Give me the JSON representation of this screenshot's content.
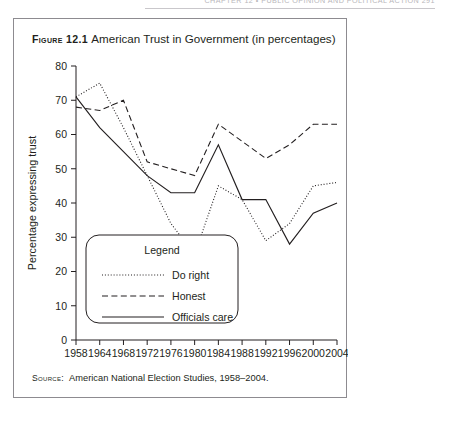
{
  "running_header": {
    "text": "CHAPTER 12  •  PUBLIC OPINION AND POLITICAL ACTION   291"
  },
  "figure": {
    "label": "Figure 12.1",
    "caption": "American Trust in Government (in percentages)",
    "source_label": "Source:",
    "source_text": "American National Election Studies, 1958–2004."
  },
  "chart_data": {
    "type": "line",
    "title": "American Trust in Government (in percentages)",
    "xlabel": "",
    "ylabel": "Percentage expressing trust",
    "x": [
      1958,
      1964,
      1968,
      1972,
      1976,
      1980,
      1984,
      1988,
      1992,
      1996,
      2000,
      2004
    ],
    "xtick_labels": [
      "1958",
      "1964",
      "1968",
      "1972",
      "1976",
      "1980",
      "1984",
      "1988",
      "1992",
      "1996",
      "2000",
      "2004"
    ],
    "ytick_labels": [
      "0",
      "10",
      "20",
      "30",
      "40",
      "50",
      "60",
      "70",
      "80"
    ],
    "yticks": [
      0,
      10,
      20,
      30,
      40,
      50,
      60,
      70,
      80
    ],
    "ylim": [
      0,
      80
    ],
    "grid": false,
    "legend_position": "lower-left-inside",
    "legend_title": "Legend",
    "series": [
      {
        "key": "do_right",
        "name": "Do right",
        "style": "dotted",
        "values": [
          71,
          75,
          62,
          48,
          34,
          25,
          45,
          41,
          29,
          34,
          45,
          46
        ]
      },
      {
        "key": "honest",
        "name": "Honest",
        "style": "dashed",
        "values": [
          68,
          67,
          70,
          52,
          50,
          48,
          63,
          58,
          53,
          57,
          63,
          63
        ]
      },
      {
        "key": "officials_care",
        "name": "Officials care",
        "style": "solid",
        "values": [
          71,
          62,
          55,
          48,
          43,
          43,
          57,
          41,
          41,
          28,
          37,
          40
        ]
      }
    ]
  },
  "colors": {
    "ink": "#231f20",
    "box_border": "#8d8b90",
    "header_rule": "#c9c7cb"
  }
}
